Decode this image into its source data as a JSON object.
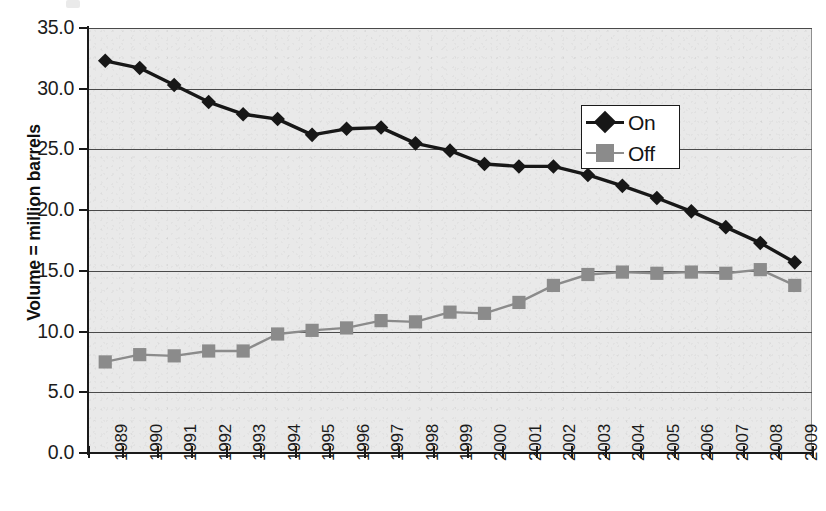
{
  "chart_data": {
    "type": "line",
    "title": "",
    "subtitle": "",
    "xlabel": "",
    "ylabel": "Volume = million barrels",
    "ylim": [
      0.0,
      35.0
    ],
    "ytick_step": 5.0,
    "ytick_labels": [
      "35.0",
      "30.0",
      "25.0",
      "20.0",
      "15.0",
      "10.0",
      "5.0",
      "0.0"
    ],
    "ytick_values": [
      35.0,
      30.0,
      25.0,
      20.0,
      15.0,
      10.0,
      5.0,
      0.0
    ],
    "grid": "horizontal",
    "legend_position": "top-right",
    "categories": [
      "1989",
      "1990",
      "1991",
      "1992",
      "1993",
      "1994",
      "1995",
      "1996",
      "1997",
      "1998",
      "1999",
      "2000",
      "2001",
      "2002",
      "2003",
      "2004",
      "2005",
      "2006",
      "2007",
      "2008",
      "2009"
    ],
    "x": [
      1989,
      1990,
      1991,
      1992,
      1993,
      1994,
      1995,
      1996,
      1997,
      1998,
      1999,
      2000,
      2001,
      2002,
      2003,
      2004,
      2005,
      2006,
      2007,
      2008,
      2009
    ],
    "series": [
      {
        "name": "On",
        "marker": "diamond",
        "color": "#171717",
        "values": [
          32.3,
          31.7,
          30.3,
          28.9,
          27.9,
          27.5,
          26.2,
          26.7,
          26.8,
          25.5,
          24.9,
          23.8,
          23.6,
          23.6,
          22.9,
          22.0,
          21.0,
          19.9,
          18.6,
          17.3,
          15.7
        ]
      },
      {
        "name": "Off",
        "marker": "square",
        "color": "#8b8b8b",
        "values": [
          7.5,
          8.1,
          8.0,
          8.4,
          8.4,
          9.8,
          10.1,
          10.3,
          10.9,
          10.8,
          11.6,
          11.5,
          12.4,
          13.8,
          14.7,
          14.9,
          14.8,
          14.9,
          14.8,
          15.1,
          13.8
        ]
      }
    ],
    "legend": [
      "On",
      "Off"
    ],
    "colors": {
      "plot_background": "#e9e9e9",
      "page_background": "#ffffff",
      "axis": "#1a1a1a",
      "gridline": "#4a4a4a",
      "series_on": "#171717",
      "series_off": "#8b8b8b"
    }
  }
}
